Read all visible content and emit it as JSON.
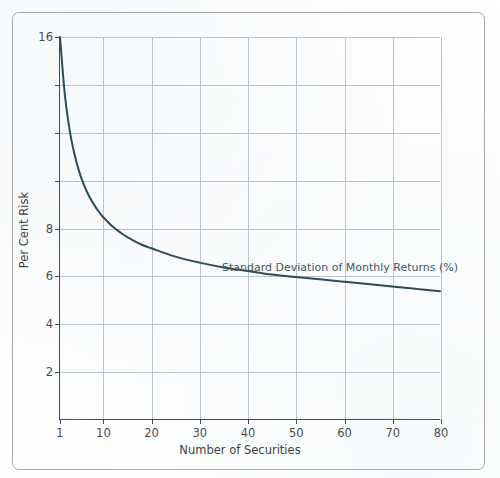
{
  "figure": {
    "frame_color": "#a9a9a9",
    "background_color": "#fdfdfd"
  },
  "chart_data": {
    "type": "line",
    "title": "",
    "subtitle": "",
    "xlabel": "Number of Securities",
    "ylabel": "Per Cent Risk",
    "annotation": "Standard Deviation of Monthly Returns (%)",
    "legend_position": "inline-annotation",
    "grid": true,
    "xlim": [
      1,
      80
    ],
    "ylim": [
      0,
      16
    ],
    "xticks": [
      1,
      10,
      20,
      30,
      40,
      50,
      60,
      70,
      80
    ],
    "xticklabels": [
      "1",
      "10",
      "20",
      "30",
      "40",
      "50",
      "60",
      "70",
      "80"
    ],
    "yticks": [
      2,
      4,
      6,
      8,
      10,
      12,
      14,
      16
    ],
    "yticklabels": [
      "2",
      "4",
      "6",
      "8",
      "",
      "",
      "",
      "16"
    ],
    "ytick_labeled": [
      2,
      4,
      6,
      8,
      16
    ],
    "line_color": "#2f4b57",
    "line_width": 2.0,
    "grid_color": "#b9c4cc",
    "axis_color": "#4a4a4a",
    "series": [
      {
        "name": "Standard Deviation of Monthly Returns (%)",
        "x": [
          1,
          2,
          3,
          4,
          5,
          6,
          7,
          8,
          9,
          10,
          12,
          14,
          16,
          18,
          20,
          25,
          30,
          35,
          40,
          45,
          50,
          55,
          60,
          65,
          70,
          75,
          80
        ],
        "values": [
          16.0,
          13.6,
          12.1,
          11.1,
          10.35,
          9.8,
          9.35,
          9.0,
          8.7,
          8.45,
          8.05,
          7.75,
          7.5,
          7.3,
          7.15,
          6.8,
          6.55,
          6.35,
          6.2,
          6.05,
          5.95,
          5.85,
          5.75,
          5.65,
          5.55,
          5.45,
          5.35
        ]
      }
    ]
  },
  "axis_labels": {
    "y": [
      {
        "value": 16,
        "text": "16"
      },
      {
        "value": 14,
        "text": ""
      },
      {
        "value": 12,
        "text": ""
      },
      {
        "value": 10,
        "text": ""
      },
      {
        "value": 8,
        "text": "8"
      },
      {
        "value": 6,
        "text": "6"
      },
      {
        "value": 4,
        "text": "4"
      },
      {
        "value": 2,
        "text": "2"
      }
    ],
    "x": [
      {
        "value": 1,
        "text": "1"
      },
      {
        "value": 10,
        "text": "10"
      },
      {
        "value": 20,
        "text": "20"
      },
      {
        "value": 30,
        "text": "30"
      },
      {
        "value": 40,
        "text": "40"
      },
      {
        "value": 50,
        "text": "50"
      },
      {
        "value": 60,
        "text": "60"
      },
      {
        "value": 70,
        "text": "70"
      },
      {
        "value": 80,
        "text": "80"
      }
    ]
  }
}
